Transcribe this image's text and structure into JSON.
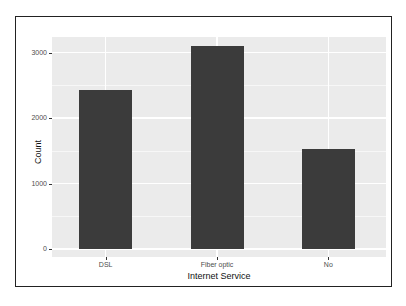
{
  "chart_data": {
    "type": "bar",
    "title": "",
    "xlabel": "Internet Service",
    "ylabel": "Count",
    "categories": [
      "DSL",
      "Fiber optic",
      "No"
    ],
    "values": [
      2421,
      3096,
      1526
    ],
    "ylim": [
      0,
      3300
    ],
    "yticks": [
      0,
      1000,
      2000,
      3000
    ],
    "ytick_labels": [
      "0",
      "1000",
      "2000",
      "3000"
    ],
    "grid": true,
    "legend": "none",
    "bar_color": "#3b3b3b",
    "panel_background": "#ebebeb"
  },
  "axes": {
    "xlabel": "Internet Service",
    "ylabel": "Count",
    "yticks": [
      "0",
      "1000",
      "2000",
      "3000"
    ],
    "xticks": [
      "DSL",
      "Fiber optic",
      "No"
    ]
  }
}
